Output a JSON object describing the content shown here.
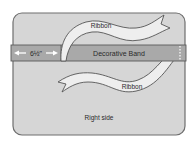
{
  "diagram": {
    "measurement_label": "6½\"",
    "band_label": "Decorative Band",
    "ribbon_upper_label": "Ribbon",
    "ribbon_lower_label": "Ribbon",
    "side_label": "Right side"
  },
  "colors": {
    "fabric": "#d6d6d6",
    "fabric_border": "#6e6e6e",
    "band": "#a9a9a9",
    "band_border": "#5a5a5a",
    "ribbon": "#eeeeee",
    "ribbon_border": "#555555",
    "text": "#2a2a2a"
  }
}
